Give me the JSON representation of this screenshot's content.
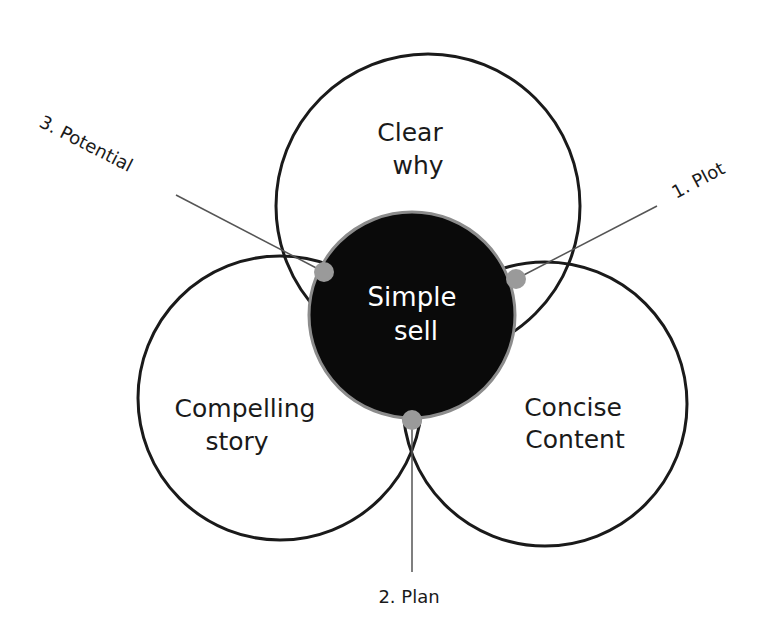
{
  "diagram": {
    "type": "venn",
    "center": {
      "line1": "Simple",
      "line2": "sell",
      "fill": "#0a0a0a",
      "stroke": "#8c8c8c"
    },
    "circles": [
      {
        "id": "top",
        "line1": "Clear",
        "line2": "why"
      },
      {
        "id": "left",
        "line1": "Compelling",
        "line2": "story"
      },
      {
        "id": "right",
        "line1": "Concise",
        "line2": "Content"
      }
    ],
    "callouts": [
      {
        "id": "plot",
        "label": "1. Plot"
      },
      {
        "id": "plan",
        "label": "2. Plan"
      },
      {
        "id": "potential",
        "label": "3. Potential"
      }
    ],
    "colors": {
      "outline": "#1a1a1a",
      "dot": "#9a9a9a",
      "leader_line": "#555555"
    }
  }
}
